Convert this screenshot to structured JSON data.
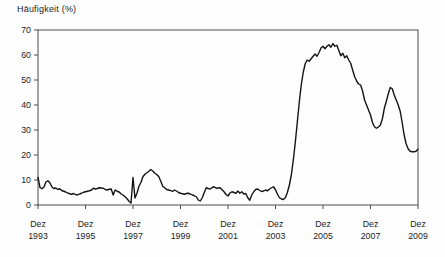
{
  "chart": {
    "title": "Häufigkeit (%)"
  },
  "chart_data": {
    "type": "line",
    "title": "Häufigkeit (%)",
    "ylabel": "Häufigkeit (%)",
    "xlabel": "",
    "ylim": [
      0,
      70
    ],
    "y_ticks": [
      0,
      10,
      20,
      30,
      40,
      50,
      60,
      70
    ],
    "x_tick_labels": [
      {
        "month": "Dez",
        "year": "1993"
      },
      {
        "month": "Dez",
        "year": "1995"
      },
      {
        "month": "Dez",
        "year": "1997"
      },
      {
        "month": "Dez",
        "year": "1999"
      },
      {
        "month": "Dez",
        "year": "2001"
      },
      {
        "month": "Dez",
        "year": "2003"
      },
      {
        "month": "Dez",
        "year": "2005"
      },
      {
        "month": "Dez",
        "year": "2007"
      },
      {
        "month": "Dez",
        "year": "2009"
      }
    ],
    "grid": false,
    "legend": "none",
    "line_color": "#141414",
    "axis_color": "#4d4d4d",
    "series": [
      {
        "name": "Häufigkeit (%)",
        "start": "Dez 1993",
        "end": "Dez 2009",
        "step": "month",
        "values": [
          11.0,
          7.0,
          6.5,
          7.2,
          9.2,
          9.7,
          8.9,
          7.3,
          6.6,
          6.8,
          6.2,
          6.5,
          5.8,
          5.5,
          5.2,
          4.8,
          4.5,
          4.3,
          4.6,
          4.2,
          4.0,
          4.4,
          4.7,
          5.1,
          5.3,
          5.5,
          5.7,
          6.0,
          6.7,
          6.4,
          6.6,
          6.9,
          6.8,
          6.7,
          6.2,
          6.0,
          6.3,
          6.4,
          4.0,
          6.0,
          5.5,
          5.2,
          4.4,
          4.0,
          3.3,
          2.5,
          1.5,
          0.8,
          11.0,
          2.8,
          4.7,
          7.5,
          9.0,
          11.3,
          12.3,
          12.9,
          13.5,
          14.2,
          13.6,
          12.7,
          12.2,
          11.4,
          9.6,
          7.5,
          6.9,
          6.2,
          6.0,
          5.8,
          5.4,
          6.0,
          5.6,
          5.0,
          4.7,
          4.5,
          4.3,
          4.6,
          4.7,
          4.4,
          4.0,
          3.7,
          3.3,
          2.0,
          1.6,
          2.9,
          5.0,
          6.9,
          6.6,
          6.4,
          7.0,
          7.3,
          6.7,
          6.8,
          6.9,
          6.1,
          5.3,
          4.2,
          3.6,
          4.8,
          5.3,
          5.0,
          4.7,
          5.6,
          4.7,
          5.3,
          4.4,
          4.6,
          2.9,
          1.9,
          4.0,
          5.3,
          6.2,
          6.4,
          5.8,
          5.4,
          5.6,
          6.0,
          5.7,
          6.4,
          6.9,
          7.3,
          6.1,
          4.3,
          2.9,
          2.4,
          2.2,
          3.0,
          5.0,
          8.0,
          12.0,
          18.0,
          25.0,
          33.0,
          41.0,
          48.0,
          53.0,
          56.5,
          58.0,
          57.5,
          58.5,
          59.5,
          60.4,
          59.5,
          61.0,
          62.8,
          63.5,
          62.5,
          63.5,
          64.1,
          63.1,
          64.6,
          63.5,
          63.9,
          61.8,
          59.7,
          60.7,
          58.9,
          59.7,
          58.0,
          56.7,
          53.9,
          51.3,
          49.6,
          48.4,
          48.0,
          45.6,
          42.0,
          40.0,
          38.0,
          36.0,
          33.0,
          31.3,
          30.7,
          31.2,
          32.0,
          34.5,
          38.7,
          41.5,
          44.5,
          47.0,
          46.5,
          44.0,
          42.0,
          40.0,
          37.5,
          33.0,
          28.0,
          24.5,
          22.5,
          21.5,
          21.3,
          21.3,
          21.5,
          22.3
        ]
      }
    ]
  }
}
